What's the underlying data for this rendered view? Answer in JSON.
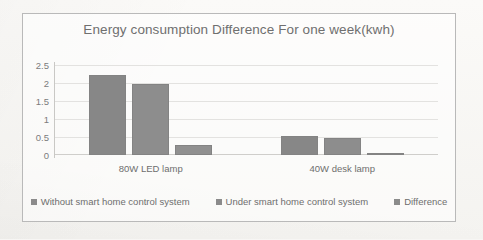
{
  "chart_data": {
    "type": "bar",
    "title": "Energy consumption Difference For one week(kwh)",
    "xlabel": "",
    "ylabel": "",
    "ylim": [
      0,
      2.5
    ],
    "yticks": [
      "0",
      "0.5",
      "1",
      "1.5",
      "2",
      "2.5"
    ],
    "grid": true,
    "legend_position": "bottom",
    "categories": [
      "80W LED lamp",
      "40W desk lamp"
    ],
    "series": [
      {
        "name": "Without smart home control system",
        "values": [
          2.22,
          0.53
        ]
      },
      {
        "name": "Under smart home control system",
        "values": [
          1.96,
          0.47
        ]
      },
      {
        "name": "Difference",
        "values": [
          0.27,
          0.05
        ]
      }
    ]
  }
}
